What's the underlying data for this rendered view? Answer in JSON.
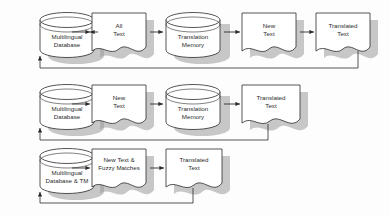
{
  "diagram": {
    "type": "flowchart",
    "colors": {
      "background": "#fdfdfd",
      "shape_fill": "#ffffff",
      "shape_stroke": "#2b2b2b",
      "shadow": "#8a8a8a",
      "text": "#2b2b2b",
      "connector": "#2b2b2b"
    },
    "rows": [
      {
        "id": "row-1",
        "name": "first-pass-all-text",
        "nodes": [
          {
            "id": "r1-db",
            "shape": "cylinder",
            "lines": [
              "Multilingual",
              "Database"
            ]
          },
          {
            "id": "r1-all",
            "shape": "document",
            "lines": [
              "All",
              "Text"
            ]
          },
          {
            "id": "r1-tm",
            "shape": "cylinder",
            "lines": [
              "Translation",
              "Memory"
            ]
          },
          {
            "id": "r1-new",
            "shape": "document",
            "lines": [
              "New",
              "Text"
            ]
          },
          {
            "id": "r1-tr",
            "shape": "document",
            "lines": [
              "Translated",
              "Text"
            ]
          }
        ],
        "feedback": "r1-tr-to-r1-db"
      },
      {
        "id": "row-2",
        "name": "second-pass-new-text",
        "nodes": [
          {
            "id": "r2-db",
            "shape": "cylinder",
            "lines": [
              "Multilingual",
              "Database"
            ]
          },
          {
            "id": "r2-new",
            "shape": "document",
            "lines": [
              "New",
              "Text"
            ]
          },
          {
            "id": "r2-tm",
            "shape": "cylinder",
            "lines": [
              "Translation",
              "Memory"
            ]
          },
          {
            "id": "r2-tr",
            "shape": "document",
            "lines": [
              "Translated",
              "Text"
            ]
          }
        ],
        "feedback": "r2-tr-to-r2-db"
      },
      {
        "id": "row-3",
        "name": "third-pass-fuzzy-matches",
        "nodes": [
          {
            "id": "r3-db",
            "shape": "cylinder",
            "lines": [
              "Multilingual",
              "Database & TM"
            ]
          },
          {
            "id": "r3-fuzzy",
            "shape": "document",
            "lines": [
              "New Text &",
              "Fuzzy Matches"
            ]
          },
          {
            "id": "r3-tr",
            "shape": "document",
            "lines": [
              "Translated",
              "Text"
            ]
          }
        ],
        "feedback": "r3-tr-to-r3-db"
      }
    ]
  }
}
